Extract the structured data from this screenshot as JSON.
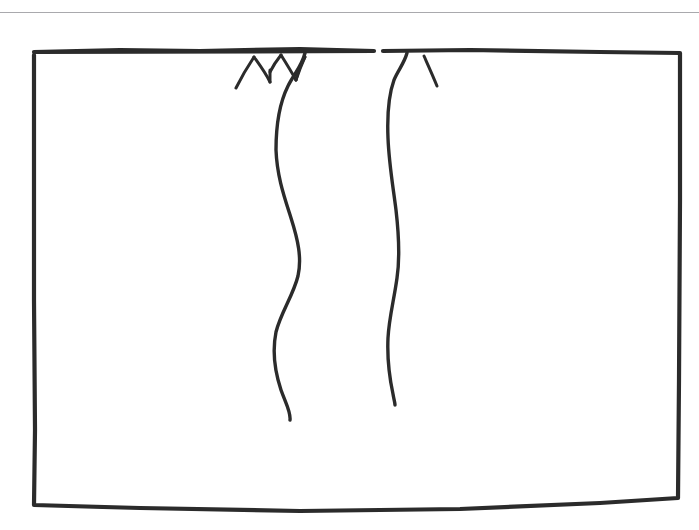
{
  "page": {
    "background_color": "#ffffff",
    "width": 699,
    "height": 530
  },
  "top_rule": {
    "name": "horizontal-divider",
    "color": "#a9a9ad",
    "y": 12,
    "thickness": 1
  },
  "drawing": {
    "description": "Hand-drawn rectangular frame with two wavy vertical lines hanging from the top edge, each topped by small V-shaped branch forks",
    "ink_color": "#2b2b2b",
    "frame": {
      "name": "sketch-frame",
      "top_left": [
        34,
        52
      ],
      "top_right": [
        680,
        53
      ],
      "bottom_right": [
        678,
        498
      ],
      "bottom_left": [
        34,
        505
      ],
      "top_gap": [
        375,
        382
      ],
      "path": "M 34 55 L 34 300 L 35 430 L 34 505 L 140 508 L 300 511 L 460 509 L 600 503 L 678 498 L 679 380 L 680 200 L 680 53 L 600 52 L 470 50 L 383 51 M 374 51 L 300 49 L 200 51 L 120 50 L 34 52 Z"
    },
    "strands": [
      {
        "name": "left-hanging-strand",
        "start": [
          305,
          53
        ],
        "end": [
          290,
          420
        ],
        "path": "M 305 53 C 302 66, 294 74, 288 86 C 280 102, 276 124, 276 150 C 277 176, 284 196, 291 218 C 298 240, 302 258, 298 276 C 293 296, 281 312, 276 332 C 272 352, 275 372, 281 390 C 286 404, 291 412, 290 420"
      },
      {
        "name": "right-hanging-strand",
        "start": [
          407,
          53
        ],
        "end": [
          395,
          405
        ],
        "path": "M 407 53 C 404 64, 398 70, 394 80 C 389 94, 387 114, 388 138 C 389 164, 393 186, 396 210 C 399 236, 400 258, 397 278 C 394 300, 389 318, 388 338 C 387 360, 390 380, 393 394 C 394 400, 395 403, 395 405"
      }
    ],
    "branches": [
      {
        "name": "branch-fork-left-outer",
        "path": "M 236 88 C 241 78, 248 66, 254 57"
      },
      {
        "name": "branch-fork-left-inner",
        "path": "M 254 57 C 259 64, 265 72, 270 82"
      },
      {
        "name": "branch-fork-left-descender",
        "path": "M 270 82 C 270 78, 270 73, 270 70"
      },
      {
        "name": "branch-fork-mid-left",
        "path": "M 270 72 C 273 66, 277 60, 281 55"
      },
      {
        "name": "branch-fork-mid-descender",
        "path": "M 281 55 C 286 63, 291 71, 296 80"
      },
      {
        "name": "branch-fork-mid-right-arm",
        "path": "M 296 80 C 298 74, 301 66, 305 57"
      },
      {
        "name": "branch-fork-right-arm-outer",
        "path": "M 305 57 C 302 62, 299 68, 296 80"
      },
      {
        "name": "branch-fork-far-right",
        "path": "M 437 86 C 433 76, 428 65, 424 56"
      }
    ]
  }
}
